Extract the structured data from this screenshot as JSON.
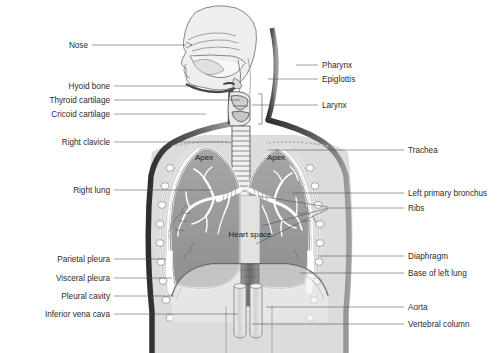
{
  "figure": {
    "type": "anatomical-diagram",
    "background_color": "#ffffff",
    "label_color": "#2b2b2b",
    "leader_line_color": "#4a4a4a"
  },
  "colors": {
    "body_outline": "#3a3a3a",
    "torso_fill": "#dcdcdc",
    "lung_fill": "#9a9a9a",
    "lung_inner": "#8e8e8e",
    "pleura_white": "#f6f6f6",
    "bronchi_white": "#ffffff",
    "head_fill": "#efefef",
    "heart_space_fill": "#e4e4e4",
    "vessel_fill": "#d8d8d8",
    "vertebra_fill": "#777777"
  },
  "left_labels": [
    {
      "id": "nose",
      "text": "Nose",
      "x": 88,
      "y": 48,
      "lx": 92,
      "ly": 45,
      "tx": 186,
      "ty": 45
    },
    {
      "id": "hyoid-bone",
      "text": "Hyoid bone",
      "x": 110,
      "y": 89,
      "lx": 114,
      "ly": 86,
      "tx": 196,
      "ty": 86
    },
    {
      "id": "thyroid-cartilage",
      "text": "Thyroid cartilage",
      "x": 110,
      "y": 103,
      "lx": 114,
      "ly": 100,
      "tx": 240,
      "ty": 100
    },
    {
      "id": "cricoid-cartilage",
      "text": "Cricoid cartilage",
      "x": 110,
      "y": 117,
      "lx": 114,
      "ly": 114,
      "tx": 206,
      "ty": 114
    },
    {
      "id": "right-clavicle",
      "text": "Right clavicle",
      "x": 110,
      "y": 145,
      "lx": 114,
      "ly": 142,
      "tx": 230,
      "ty": 142
    },
    {
      "id": "right-lung",
      "text": "Right lung",
      "x": 110,
      "y": 193,
      "lx": 114,
      "ly": 190,
      "tx": 212,
      "ty": 190
    },
    {
      "id": "parietal-pleura",
      "text": "Parietal pleura",
      "x": 110,
      "y": 262,
      "lx": 114,
      "ly": 259,
      "tx": 166,
      "ty": 259
    },
    {
      "id": "visceral-pleura",
      "text": "Visceral pleura",
      "x": 110,
      "y": 281,
      "lx": 114,
      "ly": 278,
      "tx": 172,
      "ty": 278
    },
    {
      "id": "pleural-cavity",
      "text": "Pleural cavity",
      "x": 110,
      "y": 299,
      "lx": 114,
      "ly": 296,
      "tx": 174,
      "ty": 296
    },
    {
      "id": "inferior-vena-cava",
      "text": "Inferior vena cava",
      "x": 110,
      "y": 317,
      "lx": 114,
      "ly": 314,
      "tx": 238,
      "ty": 314
    }
  ],
  "right_labels": [
    {
      "id": "pharynx",
      "text": "Pharynx",
      "x": 322,
      "y": 68,
      "lx": 318,
      "ly": 65,
      "tx": 296,
      "ty": 65
    },
    {
      "id": "epiglottis",
      "text": "Epiglottis",
      "x": 322,
      "y": 82,
      "lx": 318,
      "ly": 79,
      "tx": 268,
      "ty": 79
    },
    {
      "id": "larynx",
      "text": "Larynx",
      "x": 322,
      "y": 108,
      "lx": 318,
      "ly": 105,
      "tx": 252,
      "ty": 105
    },
    {
      "id": "trachea",
      "text": "Trachea",
      "x": 408,
      "y": 153,
      "lx": 404,
      "ly": 150,
      "tx": 268,
      "ty": 150
    },
    {
      "id": "left-primary-bronchus",
      "text": "Left primary bronchus",
      "x": 408,
      "y": 196,
      "lx": 404,
      "ly": 193,
      "tx": 292,
      "ty": 193
    },
    {
      "id": "ribs",
      "text": "Ribs",
      "x": 408,
      "y": 211,
      "lx": 404,
      "ly": 208,
      "tx": 330,
      "ty": 208
    },
    {
      "id": "diaphragm",
      "text": "Diaphragm",
      "x": 408,
      "y": 259,
      "lx": 404,
      "ly": 256,
      "tx": 318,
      "ty": 256
    },
    {
      "id": "base-of-left-lung",
      "text": "Base of left lung",
      "x": 408,
      "y": 276,
      "lx": 404,
      "ly": 273,
      "tx": 300,
      "ty": 273
    },
    {
      "id": "aorta",
      "text": "Aorta",
      "x": 408,
      "y": 310,
      "lx": 404,
      "ly": 307,
      "tx": 266,
      "ty": 307
    },
    {
      "id": "vertebral-column",
      "text": "Vertebral column",
      "x": 408,
      "y": 327,
      "lx": 404,
      "ly": 324,
      "tx": 252,
      "ty": 324
    }
  ],
  "ribs_fan": [
    {
      "id": "rib-lead-1",
      "x1": 328,
      "y1": 207,
      "x2": 258,
      "y2": 196
    },
    {
      "id": "rib-lead-2",
      "x1": 328,
      "y1": 208,
      "x2": 262,
      "y2": 226
    },
    {
      "id": "rib-lead-3",
      "x1": 328,
      "y1": 209,
      "x2": 256,
      "y2": 244
    }
  ],
  "inner_labels": [
    {
      "id": "apex-right",
      "text": "Apex",
      "x": 204,
      "y": 160
    },
    {
      "id": "apex-left",
      "text": "Apex",
      "x": 276,
      "y": 160
    },
    {
      "id": "heart-space",
      "text": "Heart space",
      "x": 250,
      "y": 237
    }
  ]
}
